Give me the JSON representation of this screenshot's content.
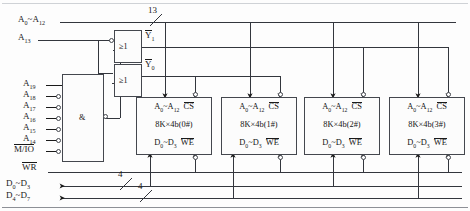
{
  "diagram": {
    "type": "digital-logic-schematic",
    "colors": {
      "line": "#33363d",
      "text": "#141414",
      "background": "#fdfdfd"
    }
  },
  "buses": {
    "address_low": {
      "label": "A0~A12",
      "label_sub_from": "0",
      "label_sub_to": "12",
      "width_tag": "13"
    },
    "address_a13": {
      "label": "A13"
    },
    "write_enable": {
      "label": "WR",
      "overbar": true
    },
    "data_low": {
      "label": "D0~D3",
      "width_tag": "4"
    },
    "data_high": {
      "label": "D4~D7",
      "width_tag": "4"
    }
  },
  "decoder": {
    "and_gate": {
      "symbol": "&",
      "output_inverted": true
    },
    "inputs": [
      {
        "label": "A19",
        "inverted": false
      },
      {
        "label": "A18",
        "inverted": true
      },
      {
        "label": "A17",
        "inverted": true
      },
      {
        "label": "A16",
        "inverted": true
      },
      {
        "label": "A15",
        "inverted": true
      },
      {
        "label": "A14",
        "inverted": true
      },
      {
        "label": "M/IO",
        "overbar": true,
        "inverted": true
      }
    ],
    "or_gates": [
      {
        "symbol": "≥1",
        "output": "Y1",
        "output_overbar": true,
        "top_input_inverted": true
      },
      {
        "symbol": "≥1",
        "output": "Y0",
        "output_overbar": true,
        "top_input_inverted": false
      }
    ]
  },
  "chips": [
    {
      "addr": "A0~A12",
      "cs": "CS",
      "size": "8K×4b(0#)",
      "data": "D0~D3",
      "we": "WE"
    },
    {
      "addr": "A0~A12",
      "cs": "CS",
      "size": "8K×4b(1#)",
      "data": "D0~D3",
      "we": "WE"
    },
    {
      "addr": "A0~A12",
      "cs": "CS",
      "size": "8K×4b(2#)",
      "data": "D0~D3",
      "we": "WE"
    },
    {
      "addr": "A0~A12",
      "cs": "CS",
      "size": "8K×4b(3#)",
      "data": "D0~D3",
      "we": "WE"
    }
  ]
}
